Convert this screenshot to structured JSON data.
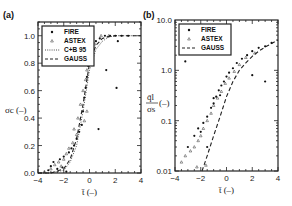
{
  "chart_data": [
    {
      "panel": "(a)",
      "type": "scatter",
      "xlabel": "t̄ (–)",
      "ylabel": "σc (–)",
      "xlim": [
        -4,
        4
      ],
      "ylim": [
        0,
        1.1
      ],
      "xticks": [
        "-4",
        "-2",
        "0",
        "2",
        "4"
      ],
      "yticks": [
        "0.0",
        "0.2",
        "0.4",
        "0.6",
        "0.8",
        "1.0"
      ],
      "legend": [
        "FIRE",
        "ASTEX",
        "C+B 95",
        "GAUSS"
      ],
      "legend_position": "upper left",
      "series": [
        {
          "name": "FIRE",
          "marker": "filled-circle",
          "points": [
            [
              -3.2,
              0.02
            ],
            [
              -3.0,
              0.05
            ],
            [
              -2.8,
              0.08
            ],
            [
              -2.5,
              0.03
            ],
            [
              -2.3,
              0.1
            ],
            [
              -2.1,
              0.04
            ],
            [
              -2.0,
              0.12
            ],
            [
              -1.8,
              0.01
            ],
            [
              -1.6,
              0.15
            ],
            [
              -1.4,
              0.18
            ],
            [
              -1.2,
              0.2
            ],
            [
              -1.0,
              0.25
            ],
            [
              -0.8,
              0.3
            ],
            [
              -0.6,
              0.35
            ],
            [
              -0.5,
              0.45
            ],
            [
              -0.4,
              0.55
            ],
            [
              -0.3,
              0.62
            ],
            [
              -0.2,
              0.7
            ],
            [
              -0.1,
              0.78
            ],
            [
              0.0,
              0.85
            ],
            [
              0.2,
              0.92
            ],
            [
              0.5,
              0.96
            ],
            [
              0.8,
              0.98
            ],
            [
              1.2,
              1.0
            ],
            [
              1.6,
              1.0
            ],
            [
              2.0,
              1.0
            ],
            [
              2.5,
              1.0
            ],
            [
              3.0,
              1.0
            ],
            [
              2.2,
              0.96
            ],
            [
              2.1,
              0.62
            ],
            [
              1.3,
              0.75
            ],
            [
              0.7,
              0.32
            ]
          ]
        },
        {
          "name": "ASTEX",
          "marker": "open-triangle",
          "points": [
            [
              -3.5,
              0.01
            ],
            [
              -3.0,
              0.03
            ],
            [
              -2.7,
              0.06
            ],
            [
              -2.4,
              0.08
            ],
            [
              -2.2,
              0.05
            ],
            [
              -2.0,
              0.1
            ],
            [
              -1.8,
              0.14
            ],
            [
              -1.6,
              0.18
            ],
            [
              -1.3,
              0.22
            ],
            [
              -1.0,
              0.28
            ],
            [
              -0.9,
              0.4
            ],
            [
              -0.7,
              0.5
            ],
            [
              -0.5,
              0.6
            ],
            [
              -0.3,
              0.68
            ],
            [
              -0.2,
              0.75
            ],
            [
              -0.1,
              0.82
            ],
            [
              0.1,
              0.88
            ],
            [
              0.4,
              0.94
            ],
            [
              0.9,
              1.0
            ],
            [
              1.5,
              1.0
            ],
            [
              -0.2,
              0.45
            ],
            [
              -0.4,
              0.38
            ],
            [
              -1.2,
              0.32
            ]
          ]
        }
      ],
      "lines": [
        {
          "name": "C+B 95",
          "style": "dotted",
          "x": [
            -4,
            -3,
            -2,
            -1.5,
            -1,
            -0.5,
            0,
            0.5,
            1,
            1.5,
            2,
            3,
            4
          ],
          "y": [
            0,
            0,
            0.02,
            0.08,
            0.2,
            0.45,
            0.75,
            0.9,
            0.96,
            0.99,
            1,
            1,
            1
          ]
        },
        {
          "name": "GAUSS",
          "style": "dashed",
          "x": [
            -4,
            -3,
            -2,
            -1.5,
            -1,
            -0.5,
            0,
            0.5,
            1,
            1.5,
            2,
            3,
            4
          ],
          "y": [
            0,
            0,
            0.03,
            0.1,
            0.25,
            0.5,
            0.8,
            0.93,
            0.98,
            0.995,
            1,
            1,
            1
          ]
        }
      ]
    },
    {
      "panel": "(b)",
      "type": "scatter",
      "xlabel": "t̄ (–)",
      "ylabel": "q̄l / σs (–)",
      "xlim": [
        -4,
        4
      ],
      "ylim": [
        0.01,
        10.0
      ],
      "yscale": "log",
      "xticks": [
        "-4",
        "-2",
        "0",
        "2",
        "4"
      ],
      "yticks": [
        "0.01",
        "0.1",
        "1.0",
        "10.0"
      ],
      "legend": [
        "FIRE",
        "ASTEX",
        "GAUSS"
      ],
      "legend_position": "upper left",
      "series": [
        {
          "name": "FIRE",
          "marker": "filled-circle",
          "points": [
            [
              -3.0,
              0.03
            ],
            [
              -2.5,
              0.05
            ],
            [
              -2.2,
              0.07
            ],
            [
              -2.0,
              0.06
            ],
            [
              -1.8,
              0.09
            ],
            [
              -1.5,
              0.12
            ],
            [
              -1.2,
              0.18
            ],
            [
              -1.0,
              0.22
            ],
            [
              -0.8,
              0.3
            ],
            [
              -0.6,
              0.4
            ],
            [
              -0.4,
              0.5
            ],
            [
              -0.2,
              0.6
            ],
            [
              0.0,
              0.75
            ],
            [
              0.2,
              0.9
            ],
            [
              0.5,
              1.1
            ],
            [
              0.8,
              1.4
            ],
            [
              1.2,
              1.7
            ],
            [
              1.6,
              2.0
            ],
            [
              2.0,
              2.4
            ],
            [
              2.5,
              2.8
            ],
            [
              3.0,
              3.0
            ],
            [
              3.5,
              3.5
            ],
            [
              -1.0,
              0.28
            ],
            [
              -0.5,
              0.32
            ],
            [
              -1.5,
              0.03
            ],
            [
              -3.2,
              1.5
            ],
            [
              -0.1,
              2.2
            ],
            [
              2.0,
              0.8
            ],
            [
              3.0,
              0.6
            ]
          ]
        },
        {
          "name": "ASTEX",
          "marker": "open-triangle",
          "points": [
            [
              -3.5,
              0.015
            ],
            [
              -3.2,
              0.02
            ],
            [
              -2.8,
              0.025
            ],
            [
              -2.5,
              0.03
            ],
            [
              -2.2,
              0.04
            ],
            [
              -2.0,
              0.05
            ],
            [
              -1.8,
              0.07
            ],
            [
              -1.5,
              0.1
            ],
            [
              -1.2,
              0.14
            ],
            [
              -1.0,
              0.2
            ],
            [
              -0.7,
              0.28
            ],
            [
              -0.4,
              0.38
            ],
            [
              -0.1,
              0.55
            ],
            [
              0.2,
              0.7
            ],
            [
              0.6,
              0.95
            ],
            [
              1.0,
              1.3
            ],
            [
              1.5,
              1.8
            ],
            [
              2.2,
              2.2
            ],
            [
              -2.3,
              0.012
            ],
            [
              -1.6,
              0.013
            ]
          ]
        }
      ],
      "lines": [
        {
          "name": "GAUSS",
          "style": "dashed",
          "x": [
            -1.9,
            -1.5,
            -1,
            -0.5,
            0,
            0.5,
            1,
            1.5,
            2,
            2.5,
            3,
            3.5,
            4
          ],
          "y": [
            0.01,
            0.02,
            0.05,
            0.12,
            0.3,
            0.6,
            1.0,
            1.4,
            1.9,
            2.4,
            2.9,
            3.4,
            4.0
          ]
        }
      ]
    }
  ],
  "labels": {
    "panel_a": "(a)",
    "panel_b": "(b)",
    "xlabel": "t̄ (–)",
    "ylabel_a": "σc (–)",
    "ylabel_b_num": "q̄l",
    "ylabel_b_den": "σs",
    "ylabel_b_unit": "(–)"
  }
}
